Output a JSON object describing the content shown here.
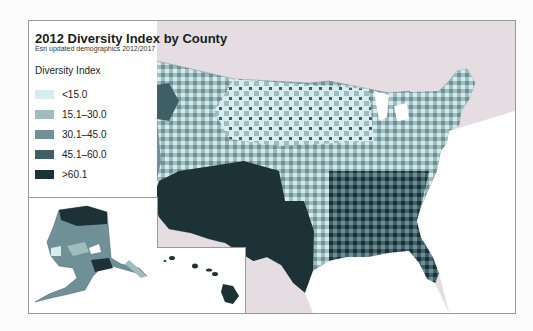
{
  "title": "2012 Diversity Index by County",
  "subtitle": "Esri updated demographics 2012/2017",
  "legend": {
    "title": "Diversity Index",
    "items": [
      {
        "label": "<15.0",
        "color": "#d6ecef"
      },
      {
        "label": "15.1–30.0",
        "color": "#9fbcbf"
      },
      {
        "label": "30.1–45.0",
        "color": "#6f9097"
      },
      {
        "label": "45.1–60.0",
        "color": "#3f5f66"
      },
      {
        "label": ">60.1",
        "color": "#1c3236"
      }
    ]
  },
  "colors": {
    "background": "#e6dde3",
    "water": "#ffffff",
    "border": "#9a9a9a"
  },
  "insets": [
    "Alaska",
    "Hawaii"
  ]
}
